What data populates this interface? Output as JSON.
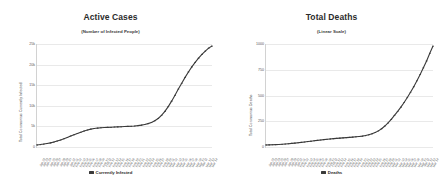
{
  "chart_data": [
    {
      "type": "line",
      "id": "active-cases",
      "title": "Active Cases",
      "subtitle": "(Number of Infected People)",
      "xlabel": "",
      "ylabel": "Total Coronavirus Currently Infected",
      "legend": [
        "Currently Infected"
      ],
      "legend_position": "bottom-center",
      "grid": true,
      "ylim": [
        0,
        25000
      ],
      "yticks": [
        0,
        5000,
        10000,
        15000,
        20000,
        25000
      ],
      "ytick_labels": [
        "0",
        "5k",
        "10k",
        "15k",
        "20k",
        "25k"
      ],
      "x": [
        "Jan 22",
        "Jan 23",
        "Jan 24",
        "Jan 25",
        "Jan 26",
        "Jan 27",
        "Jan 28",
        "Jan 29",
        "Jan 30",
        "Jan 31",
        "Feb 01",
        "Feb 02",
        "Feb 03",
        "Feb 04",
        "Feb 05",
        "Feb 06",
        "Feb 07",
        "Feb 08",
        "Feb 09",
        "Feb 10",
        "Feb 11",
        "Feb 12",
        "Feb 13",
        "Feb 14",
        "Feb 15",
        "Feb 16",
        "Feb 17",
        "Feb 18",
        "Feb 19",
        "Feb 20",
        "Feb 21",
        "Feb 22",
        "Feb 23",
        "Feb 24",
        "Feb 25",
        "Feb 26",
        "Feb 27",
        "Feb 28",
        "Feb 29",
        "Mar 01",
        "Mar 02",
        "Mar 03",
        "Mar 04",
        "Mar 05",
        "Mar 06",
        "Mar 07",
        "Mar 08",
        "Mar 09",
        "Mar 10",
        "Mar 11",
        "Mar 12",
        "Mar 13",
        "Mar 14"
      ],
      "values": [
        510,
        600,
        720,
        860,
        1000,
        1200,
        1450,
        1700,
        1980,
        2300,
        2650,
        2950,
        3250,
        3560,
        3850,
        4100,
        4300,
        4450,
        4550,
        4620,
        4680,
        4720,
        4760,
        4800,
        4840,
        4880,
        4920,
        4960,
        5000,
        5060,
        5140,
        5250,
        5400,
        5620,
        5900,
        6300,
        6850,
        7600,
        8550,
        9700,
        11000,
        12400,
        13900,
        15300,
        16700,
        18000,
        19200,
        20300,
        21300,
        22200,
        23000,
        23700,
        24200
      ],
      "series": [
        {
          "name": "Currently Infected",
          "values": [
            510,
            600,
            720,
            860,
            1000,
            1200,
            1450,
            1700,
            1980,
            2300,
            2650,
            2950,
            3250,
            3560,
            3850,
            4100,
            4300,
            4450,
            4550,
            4620,
            4680,
            4720,
            4760,
            4800,
            4840,
            4880,
            4920,
            4960,
            5000,
            5060,
            5140,
            5250,
            5400,
            5620,
            5900,
            6300,
            6850,
            7600,
            8550,
            9700,
            11000,
            12400,
            13900,
            15300,
            16700,
            18000,
            19200,
            20300,
            21300,
            22200,
            23000,
            23700,
            24200
          ]
        }
      ],
      "series_color": "#3a3a3a"
    },
    {
      "type": "line",
      "id": "total-deaths",
      "title": "Total Deaths",
      "subtitle": "(Linear Scale)",
      "xlabel": "",
      "ylabel": "Total Coronavirus Deaths",
      "legend": [
        "Deaths"
      ],
      "legend_position": "bottom-center",
      "grid": true,
      "ylim": [
        0,
        1000
      ],
      "yticks": [
        0,
        250,
        500,
        750,
        1000
      ],
      "ytick_labels": [
        "0",
        "250",
        "500",
        "750",
        "1000"
      ],
      "x": [
        "Jan 22",
        "Jan 23",
        "Jan 24",
        "Jan 25",
        "Jan 26",
        "Jan 27",
        "Jan 28",
        "Jan 29",
        "Jan 30",
        "Jan 31",
        "Feb 01",
        "Feb 02",
        "Feb 03",
        "Feb 04",
        "Feb 05",
        "Feb 06",
        "Feb 07",
        "Feb 08",
        "Feb 09",
        "Feb 10",
        "Feb 11",
        "Feb 12",
        "Feb 13",
        "Feb 14",
        "Feb 15",
        "Feb 16",
        "Feb 17",
        "Feb 18",
        "Feb 19",
        "Feb 20",
        "Feb 21",
        "Feb 22",
        "Feb 23",
        "Feb 24",
        "Feb 25",
        "Feb 26",
        "Feb 27",
        "Feb 28",
        "Feb 29",
        "Mar 01",
        "Mar 02",
        "Mar 03",
        "Mar 04",
        "Mar 05",
        "Mar 06",
        "Mar 07",
        "Mar 08",
        "Mar 09",
        "Mar 10",
        "Mar 11",
        "Mar 12",
        "Mar 13",
        "Mar 14"
      ],
      "values": [
        6,
        8,
        12,
        16,
        20,
        26,
        34,
        42,
        52,
        62,
        72,
        84,
        96,
        108,
        120,
        132,
        144,
        156,
        168,
        178,
        188,
        196,
        204,
        212,
        220,
        228,
        236,
        244,
        252,
        262,
        274,
        290,
        312,
        342,
        382,
        432,
        498,
        578,
        672,
        780,
        900,
        1020,
        1150,
        1290,
        1440,
        1600,
        1770,
        1950,
        2140,
        2340,
        2550,
        2780,
        3000
      ],
      "series": [
        {
          "name": "Deaths",
          "values": [
            6,
            8,
            12,
            16,
            20,
            26,
            34,
            42,
            52,
            62,
            72,
            84,
            96,
            108,
            120,
            132,
            144,
            156,
            168,
            178,
            188,
            196,
            204,
            212,
            220,
            228,
            236,
            244,
            252,
            262,
            274,
            290,
            312,
            342,
            382,
            432,
            498,
            578,
            672,
            780,
            900,
            1020,
            1150,
            1290,
            1440,
            1600,
            1770,
            1950,
            2140,
            2340,
            2550,
            2780,
            3000
          ]
        }
      ],
      "series_color": "#3a3a3a"
    }
  ],
  "colors": {
    "background": "#ffffff",
    "series": "#3a3a3a",
    "gridline": "#e9e9e9",
    "axis": "#d2d2d2",
    "title_text": "#2b2b2b",
    "tick_text": "#555555"
  }
}
